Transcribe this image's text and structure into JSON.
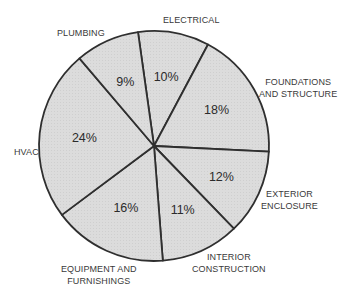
{
  "chart_data": {
    "type": "pie",
    "title": "",
    "start_angle_deg": -98,
    "direction": "clockwise",
    "slices": [
      {
        "label": "ELECTRICAL",
        "value": 10
      },
      {
        "label": "FOUNDATIONS AND STRUCTURE",
        "value": 18
      },
      {
        "label": "EXTERIOR ENCLOSURE",
        "value": 12
      },
      {
        "label": "INTERIOR CONSTRUCTION",
        "value": 11
      },
      {
        "label": "EQUIPMENT AND FURNISHINGS",
        "value": 16
      },
      {
        "label": "HVAC",
        "value": 24
      },
      {
        "label": "PLUMBING",
        "value": 9
      }
    ],
    "value_labels": [
      "10%",
      "18%",
      "12%",
      "11%",
      "16%",
      "24%",
      "9%"
    ],
    "fill_color": "#d9d9d9",
    "stroke_color": "#2f2f2f",
    "legend": "none (outside labels)"
  },
  "labels": {
    "electrical": "ELECTRICAL",
    "foundations_1": "FOUNDATIONS",
    "foundations_2": "AND STRUCTURE",
    "exterior_1": "EXTERIOR",
    "exterior_2": "ENCLOSURE",
    "interior_1": "INTERIOR",
    "interior_2": "CONSTRUCTION",
    "equipment_1": "EQUIPMENT AND",
    "equipment_2": "FURNISHINGS",
    "hvac": "HVAC",
    "plumbing": "PLUMBING"
  }
}
